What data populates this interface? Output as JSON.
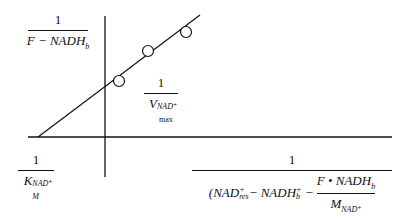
{
  "diagram": {
    "type": "double-reciprocal-plot",
    "y_axis_label": {
      "numerator": "1",
      "denominator_main": "F − NADH",
      "denominator_sub": "b"
    },
    "y_intercept_label": {
      "numerator": "1",
      "denominator_main": "V",
      "denominator_sup": "NAD⁺",
      "denominator_sub": "max"
    },
    "x_intercept_label": {
      "numerator": "1",
      "denominator_main": "K",
      "denominator_sup": "NAD⁺",
      "denominator_sub": "M"
    },
    "x_axis_label": {
      "numerator": "1",
      "part1_main": "(NAD",
      "part1_sup": "+",
      "part1_sub": "res",
      "part2_main": " − NADH",
      "part2_sup": "+",
      "part2_sub": "b",
      "part3": " − ",
      "inner_numerator": "F • NADH",
      "inner_numerator_sub": "b",
      "inner_denominator": "M",
      "inner_denominator_sub": "NAD⁺"
    },
    "data_points": [
      {
        "x": 119,
        "y": 81
      },
      {
        "x": 148,
        "y": 51
      },
      {
        "x": 186,
        "y": 32
      }
    ],
    "line": {
      "x1": 38,
      "y1": 137,
      "x2": 200,
      "y2": 15
    },
    "colors": {
      "ink": "#111111",
      "background": "#ffffff"
    }
  }
}
